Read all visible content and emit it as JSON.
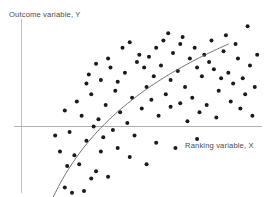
{
  "chart_data": {
    "type": "scatter",
    "title": "",
    "subtitle": "",
    "xlabel": "Ranking variable, X",
    "ylabel": "Outcome variable, Y",
    "grid": false,
    "legend": null,
    "xlim": [
      0,
      100
    ],
    "ylim": [
      -40,
      60
    ],
    "axes": {
      "vertical_axis_x": 0,
      "horizontal_axis_y": 0,
      "note": "Axes drawn as thin grey reference lines crossing at origin; no tick marks or tick labels are rendered."
    },
    "points": [
      [
        18,
        -34
      ],
      [
        21,
        -37
      ],
      [
        26,
        -36
      ],
      [
        29,
        -29
      ],
      [
        19,
        -22
      ],
      [
        24,
        -21
      ],
      [
        31,
        -25
      ],
      [
        36,
        -28
      ],
      [
        16,
        -14
      ],
      [
        22,
        -16
      ],
      [
        33,
        -14
      ],
      [
        40,
        -12
      ],
      [
        27,
        -8
      ],
      [
        34,
        -6
      ],
      [
        45,
        -17
      ],
      [
        52,
        -21
      ],
      [
        14,
        -5
      ],
      [
        20,
        -3
      ],
      [
        30,
        0
      ],
      [
        38,
        -2
      ],
      [
        47,
        -5
      ],
      [
        56,
        -9
      ],
      [
        64,
        -12
      ],
      [
        73,
        -7
      ],
      [
        25,
        6
      ],
      [
        32,
        4
      ],
      [
        41,
        8
      ],
      [
        35,
        12
      ],
      [
        18,
        9
      ],
      [
        23,
        14
      ],
      [
        29,
        18
      ],
      [
        44,
        2
      ],
      [
        50,
        10
      ],
      [
        57,
        6
      ],
      [
        46,
        16
      ],
      [
        39,
        20
      ],
      [
        33,
        26
      ],
      [
        27,
        24
      ],
      [
        52,
        22
      ],
      [
        60,
        18
      ],
      [
        43,
        30
      ],
      [
        37,
        33
      ],
      [
        48,
        36
      ],
      [
        55,
        28
      ],
      [
        62,
        26
      ],
      [
        68,
        22
      ],
      [
        58,
        34
      ],
      [
        65,
        31
      ],
      [
        71,
        16
      ],
      [
        77,
        12
      ],
      [
        82,
        20
      ],
      [
        88,
        24
      ],
      [
        75,
        28
      ],
      [
        80,
        32
      ],
      [
        86,
        30
      ],
      [
        92,
        27
      ],
      [
        70,
        38
      ],
      [
        63,
        41
      ],
      [
        56,
        44
      ],
      [
        49,
        40
      ],
      [
        78,
        36
      ],
      [
        84,
        42
      ],
      [
        90,
        38
      ],
      [
        95,
        34
      ],
      [
        66,
        46
      ],
      [
        72,
        44
      ],
      [
        59,
        48
      ],
      [
        53,
        39
      ],
      [
        87,
        14
      ],
      [
        93,
        18
      ],
      [
        97,
        22
      ],
      [
        91,
        10
      ],
      [
        74,
        8
      ],
      [
        81,
        5
      ],
      [
        69,
        3
      ],
      [
        96,
        6
      ],
      [
        42,
        44
      ],
      [
        36,
        38
      ],
      [
        61,
        52
      ],
      [
        67,
        50
      ],
      [
        79,
        48
      ],
      [
        85,
        51
      ],
      [
        94,
        56
      ],
      [
        89,
        46
      ],
      [
        31,
        35
      ],
      [
        45,
        47
      ],
      [
        51,
        33
      ],
      [
        76,
        40
      ],
      [
        28,
        29
      ],
      [
        40,
        25
      ],
      [
        54,
        15
      ],
      [
        62,
        11
      ],
      [
        83,
        27
      ],
      [
        98,
        40
      ],
      [
        73,
        33
      ],
      [
        66,
        13
      ]
    ],
    "fit_curve": {
      "label": "",
      "shape": "concave-increasing",
      "description": "Smooth logarithmic-style fitted trend line rising steeply at low X and flattening at high X",
      "x_start": 11,
      "x_end": 86,
      "y_start": -46,
      "y_end": 46
    },
    "marker": {
      "shape": "circle",
      "filled": true,
      "color": "#1a1a1a",
      "size_px": 4
    },
    "colors": {
      "marker": "#1a1a1a",
      "curve": "#5a5a5a",
      "axis": "#b8b8b8",
      "label_text": "#4a4a4a",
      "background": "#ffffff"
    }
  }
}
